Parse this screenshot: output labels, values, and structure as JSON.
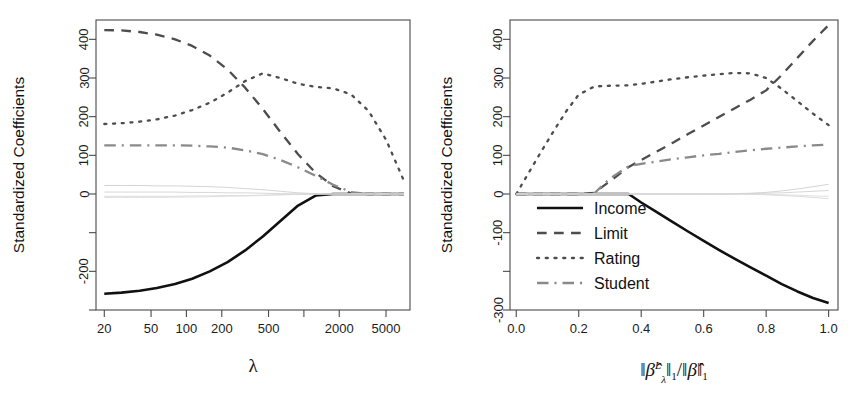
{
  "figure": {
    "background": "#ffffff",
    "ylabel": "Standardized Coefficients",
    "panels": [
      "left",
      "right"
    ]
  },
  "legend": {
    "position": "left-center of right panel",
    "entries": [
      {
        "label": "Income",
        "style": "solid",
        "color": "#111111"
      },
      {
        "label": "Limit",
        "style": "dashed",
        "color": "#4d4d4d"
      },
      {
        "label": "Rating",
        "style": "dotted",
        "color": "#4d4d4d"
      },
      {
        "label": "Student",
        "style": "dashdot",
        "color": "#8a8a8a"
      }
    ]
  },
  "chart_data": [
    {
      "id": "left-panel",
      "type": "line",
      "title": "",
      "xlabel": "λ",
      "ylabel": "Standardized Coefficients",
      "xscale": "log",
      "xlim": [
        17,
        8000
      ],
      "ylim": [
        -300,
        450
      ],
      "grid": false,
      "xticks": [
        20,
        50,
        100,
        200,
        500,
        1000,
        2000,
        5000
      ],
      "xticklabels": [
        "20",
        "50",
        "100",
        "200",
        "500",
        "",
        "2000",
        "5000"
      ],
      "yticks": [
        -300,
        -200,
        -100,
        0,
        100,
        200,
        300,
        400
      ],
      "yticklabels": [
        "",
        "-200",
        "",
        "0",
        "100",
        "200",
        "300",
        "400"
      ],
      "x": [
        20,
        28,
        40,
        56,
        80,
        112,
        158,
        224,
        316,
        447,
        631,
        891,
        1259,
        1778,
        2512,
        3548,
        5012,
        7079
      ],
      "series": [
        {
          "name": "Income",
          "style": "solid",
          "color": "#111111",
          "values": [
            -258,
            -255,
            -250,
            -243,
            -233,
            -219,
            -200,
            -176,
            -146,
            -110,
            -70,
            -30,
            -4,
            0,
            0,
            0,
            0,
            0
          ]
        },
        {
          "name": "Limit",
          "style": "dashed",
          "color": "#4d4d4d",
          "values": [
            424,
            423,
            419,
            412,
            400,
            383,
            358,
            322,
            275,
            220,
            160,
            103,
            55,
            20,
            2,
            0,
            0,
            0
          ]
        },
        {
          "name": "Rating",
          "style": "dotted",
          "color": "#4d4d4d",
          "values": [
            181,
            183,
            187,
            193,
            203,
            217,
            236,
            262,
            292,
            312,
            300,
            285,
            277,
            273,
            258,
            215,
            140,
            35
          ]
        },
        {
          "name": "Student",
          "style": "dashdot",
          "color": "#8a8a8a",
          "values": [
            126,
            126,
            126,
            126,
            126,
            125,
            123,
            120,
            113,
            103,
            88,
            69,
            47,
            24,
            5,
            0,
            0,
            0
          ]
        },
        {
          "name": "faint-1",
          "style": "solid",
          "color": "#cfcfcf",
          "values": [
            22,
            22,
            22,
            21,
            21,
            20,
            19,
            17,
            14,
            11,
            7,
            3,
            1,
            0,
            0,
            0,
            0,
            0
          ]
        },
        {
          "name": "faint-2",
          "style": "solid",
          "color": "#d8d8d8",
          "values": [
            -6,
            -6,
            -6,
            -6,
            -6,
            -5,
            -5,
            -4,
            -4,
            -3,
            -2,
            -1,
            0,
            0,
            0,
            0,
            0,
            0
          ]
        },
        {
          "name": "faint-3",
          "style": "solid",
          "color": "#dcdcdc",
          "values": [
            -9,
            -9,
            -9,
            -9,
            -8,
            -8,
            -7,
            -6,
            -5,
            -4,
            -2,
            -1,
            0,
            0,
            0,
            0,
            0,
            0
          ]
        },
        {
          "name": "faint-4",
          "style": "solid",
          "color": "#d2d2d2",
          "values": [
            5,
            5,
            5,
            5,
            5,
            4,
            4,
            3,
            3,
            2,
            1,
            0,
            0,
            0,
            0,
            0,
            0,
            0
          ]
        }
      ]
    },
    {
      "id": "right-panel",
      "type": "line",
      "title": "",
      "xlabel": "||B_lambda^L||_1 / ||B||_1",
      "ylabel": "Standardized Coefficients",
      "xscale": "linear",
      "xlim": [
        -0.02,
        1.03
      ],
      "ylim": [
        -300,
        450
      ],
      "grid": false,
      "xticks": [
        0.0,
        0.2,
        0.4,
        0.6,
        0.8,
        1.0
      ],
      "xticklabels": [
        "0.0",
        "0.2",
        "0.4",
        "0.6",
        "0.8",
        "1.0"
      ],
      "yticks": [
        -300,
        -200,
        -100,
        0,
        100,
        200,
        300,
        400
      ],
      "yticklabels": [
        "-300",
        "",
        "-100",
        "0",
        "100",
        "200",
        "300",
        "400"
      ],
      "x": [
        0.0,
        0.04,
        0.08,
        0.12,
        0.16,
        0.2,
        0.25,
        0.3,
        0.36,
        0.4,
        0.45,
        0.5,
        0.55,
        0.6,
        0.65,
        0.7,
        0.75,
        0.8,
        0.85,
        0.9,
        0.95,
        1.0
      ],
      "series": [
        {
          "name": "Income",
          "style": "solid",
          "color": "#111111",
          "values": [
            0,
            0,
            0,
            0,
            0,
            0,
            0,
            0,
            0,
            -22,
            -47,
            -72,
            -97,
            -121,
            -145,
            -168,
            -190,
            -211,
            -233,
            -252,
            -269,
            -282
          ]
        },
        {
          "name": "Limit",
          "style": "dashed",
          "color": "#4d4d4d",
          "values": [
            0,
            0,
            0,
            0,
            0,
            0,
            3,
            33,
            70,
            88,
            110,
            132,
            155,
            177,
            200,
            222,
            244,
            268,
            308,
            352,
            396,
            437
          ]
        },
        {
          "name": "Rating",
          "style": "dotted",
          "color": "#4d4d4d",
          "values": [
            0,
            55,
            110,
            163,
            214,
            257,
            278,
            280,
            281,
            285,
            291,
            297,
            302,
            306,
            310,
            313,
            312,
            300,
            272,
            240,
            208,
            178
          ]
        },
        {
          "name": "Student",
          "style": "dashdot",
          "color": "#8a8a8a",
          "values": [
            0,
            0,
            0,
            0,
            0,
            0,
            2,
            40,
            72,
            78,
            84,
            90,
            95,
            100,
            104,
            109,
            113,
            117,
            120,
            123,
            126,
            128
          ]
        },
        {
          "name": "faint-1",
          "style": "solid",
          "color": "#cfcfcf",
          "values": [
            0,
            0,
            0,
            0,
            0,
            0,
            0,
            0,
            0,
            0,
            0,
            0,
            0,
            0,
            0,
            1,
            2,
            4,
            8,
            13,
            19,
            25
          ]
        },
        {
          "name": "faint-2",
          "style": "solid",
          "color": "#d8d8d8",
          "values": [
            0,
            0,
            0,
            0,
            0,
            0,
            0,
            0,
            0,
            0,
            0,
            0,
            0,
            0,
            0,
            0,
            -1,
            -2,
            -4,
            -6,
            -9,
            -12
          ]
        },
        {
          "name": "faint-3",
          "style": "solid",
          "color": "#dcdcdc",
          "values": [
            0,
            0,
            0,
            0,
            0,
            0,
            0,
            0,
            0,
            0,
            0,
            0,
            0,
            0,
            0,
            0,
            0,
            -1,
            -2,
            -3,
            -5,
            -6
          ]
        },
        {
          "name": "faint-4",
          "style": "solid",
          "color": "#d2d2d2",
          "values": [
            0,
            0,
            0,
            0,
            0,
            0,
            0,
            0,
            0,
            0,
            0,
            0,
            0,
            0,
            0,
            0,
            1,
            2,
            3,
            5,
            7,
            9
          ]
        }
      ]
    }
  ]
}
